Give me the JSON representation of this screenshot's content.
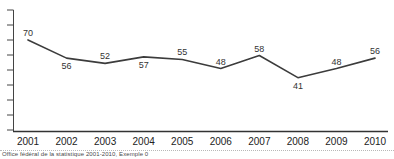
{
  "chart_data": {
    "type": "line",
    "categories": [
      "2001",
      "2002",
      "2003",
      "2004",
      "2005",
      "2006",
      "2007",
      "2008",
      "2009",
      "2010"
    ],
    "series": [
      {
        "name": "value",
        "values": [
          70,
          56,
          52,
          57,
          55,
          48,
          58,
          41,
          48,
          56
        ]
      }
    ],
    "title": "",
    "xlabel": "",
    "ylabel": "",
    "ylim": [
      0,
      93
    ],
    "grid": false,
    "legend": "none",
    "y_axis_tick_count": 9,
    "y_axis_labels_visible": false,
    "data_labels_visible": true,
    "data_label_positions": [
      "above",
      "below",
      "above",
      "below",
      "above",
      "above",
      "above",
      "below",
      "above",
      "above"
    ],
    "line_color": "#3c3c3c",
    "axis_color": "#444444",
    "label_color": "#333333"
  },
  "footer": {
    "caption": "Office fédéral de la statistique 2001-2010, Exemple 0"
  }
}
